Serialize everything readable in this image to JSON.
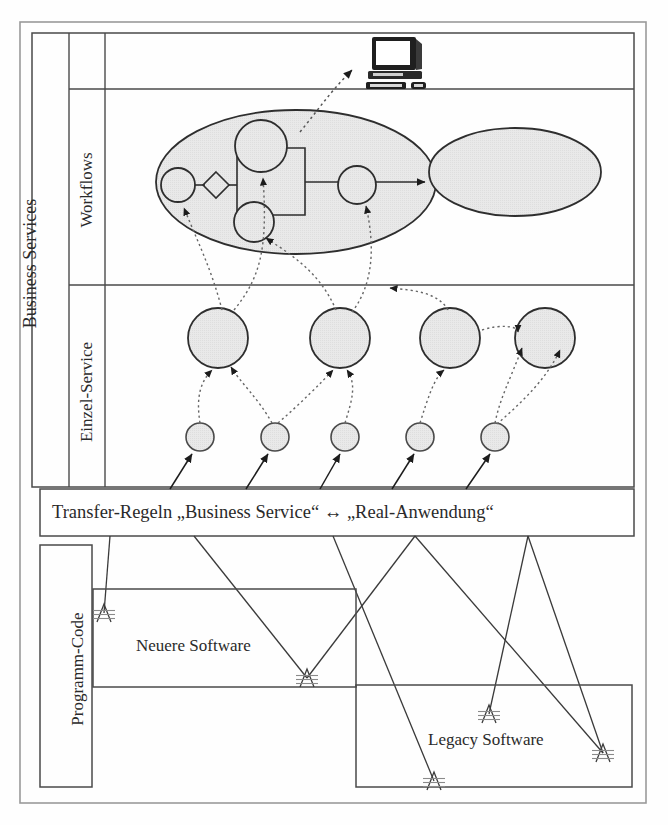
{
  "diagram": {
    "bands": {
      "business_services_label": "Business Services",
      "workflows_label": "Workflows",
      "einzel_service_label": "Einzel-Service",
      "programm_code_label": "Programm-Code"
    },
    "transfer_rule": {
      "text": "Transfer-Regeln „Business Service“ ↔ „Real-Anwendung“"
    },
    "software_boxes": [
      {
        "label": "Neuere Software"
      },
      {
        "label": "Legacy Software"
      }
    ],
    "icons": {
      "computer": "desktop-computer-icon",
      "ladder": "ladder-code-icon"
    },
    "colors": {
      "fill_gray": "#e8e8e8",
      "stroke": "#3a3a3a",
      "frame": "#555555",
      "dotted": "#666666",
      "text": "#2a2a2a"
    },
    "workflow": {
      "nodes": [
        {
          "name": "start-node",
          "cx": 178,
          "cy": 185,
          "r": 17
        },
        {
          "name": "decision-node",
          "cx": 216,
          "cy": 185,
          "r": 13
        },
        {
          "name": "task-node-upper",
          "cx": 261,
          "cy": 146,
          "r": 26
        },
        {
          "name": "task-node-lower",
          "cx": 254,
          "cy": 222,
          "r": 20
        },
        {
          "name": "end-node",
          "cx": 357,
          "cy": 185,
          "r": 19
        }
      ],
      "container_ellipse": {
        "cx": 296,
        "cy": 182,
        "rx": 140,
        "ry": 72
      },
      "target_ellipse": {
        "cx": 515,
        "cy": 172,
        "rx": 86,
        "ry": 44
      }
    },
    "service_nodes": {
      "large": [
        {
          "cx": 218,
          "cy": 338,
          "r": 30
        },
        {
          "cx": 340,
          "cy": 338,
          "r": 30
        },
        {
          "cx": 450,
          "cy": 338,
          "r": 30
        },
        {
          "cx": 545,
          "cy": 338,
          "r": 30
        }
      ],
      "small": [
        {
          "cx": 200,
          "cy": 437,
          "r": 14
        },
        {
          "cx": 275,
          "cy": 437,
          "r": 14
        },
        {
          "cx": 345,
          "cy": 437,
          "r": 14
        },
        {
          "cx": 420,
          "cy": 437,
          "r": 14
        },
        {
          "cx": 495,
          "cy": 437,
          "r": 14
        }
      ]
    },
    "ladder_markers": [
      {
        "x": 104,
        "y": 613
      },
      {
        "x": 307,
        "y": 678
      },
      {
        "x": 489,
        "y": 714
      },
      {
        "x": 434,
        "y": 781
      },
      {
        "x": 603,
        "y": 753
      }
    ]
  }
}
